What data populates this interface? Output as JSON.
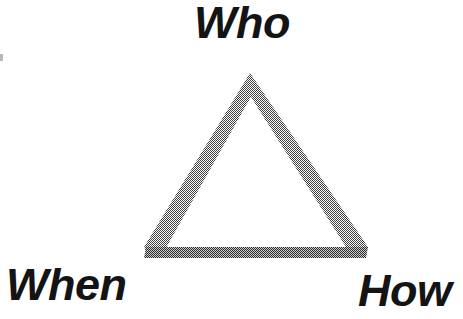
{
  "page": {
    "background_color": "#ffffff",
    "width": 463,
    "height": 319
  },
  "diagram": {
    "type": "triangle-relationship-diagram",
    "shape_name": "triangle-outline",
    "stroke": {
      "diagonal_color": "#8a8a8a",
      "base_color": "#5a5a5a",
      "diagonal_width_px": 13,
      "base_height_px": 11,
      "texture": "50% dither halftone"
    },
    "vertices": {
      "apex": {
        "x": 250,
        "y": 73
      },
      "bottom_left": {
        "x": 150,
        "y": 252
      },
      "bottom_right": {
        "x": 361,
        "y": 252
      }
    },
    "labels": [
      {
        "id": "who",
        "text": "Who",
        "corner": "apex",
        "position": "top-center",
        "color": "#141414",
        "font_size_px": 45
      },
      {
        "id": "when",
        "text": "When",
        "corner": "bottom-left",
        "position": "bottom-left",
        "color": "#141414",
        "font_size_px": 45
      },
      {
        "id": "how",
        "text": "How",
        "corner": "bottom-right",
        "position": "bottom-right",
        "color": "#141414",
        "font_size_px": 45
      }
    ]
  }
}
